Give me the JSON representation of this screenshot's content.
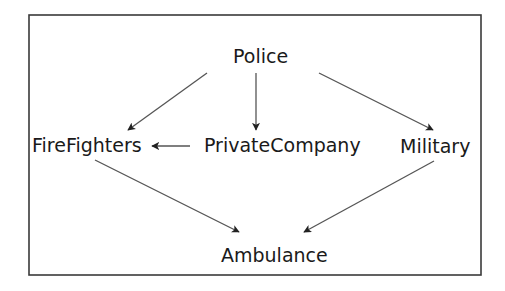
{
  "diagram": {
    "type": "directed-graph",
    "nodes": [
      {
        "id": "police",
        "label": "Police"
      },
      {
        "id": "firefighters",
        "label": "FireFighters"
      },
      {
        "id": "privatecompany",
        "label": "PrivateCompany"
      },
      {
        "id": "military",
        "label": "Military"
      },
      {
        "id": "ambulance",
        "label": "Ambulance"
      }
    ],
    "edges": [
      {
        "from": "police",
        "to": "firefighters"
      },
      {
        "from": "police",
        "to": "privatecompany"
      },
      {
        "from": "police",
        "to": "military"
      },
      {
        "from": "privatecompany",
        "to": "firefighters"
      },
      {
        "from": "firefighters",
        "to": "ambulance"
      },
      {
        "from": "military",
        "to": "ambulance"
      }
    ],
    "colors": {
      "text": "#1a1a1a",
      "edge": "#555555",
      "frame": "#3a3a3a",
      "background": "#ffffff"
    }
  }
}
